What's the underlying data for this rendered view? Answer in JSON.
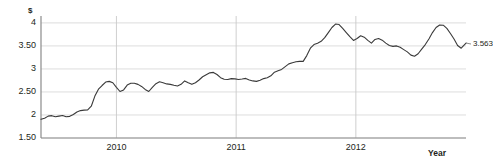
{
  "chart_data": {
    "type": "line",
    "title": "",
    "xlabel": "Year",
    "ylabel": "$",
    "ylim": [
      1.5,
      4.15
    ],
    "xlim": [
      2009.37,
      2012.92
    ],
    "grid": true,
    "legend": false,
    "y_ticks": [
      {
        "value": 4,
        "label": "4"
      },
      {
        "value": 3.5,
        "label": "3.50"
      },
      {
        "value": 3,
        "label": "3"
      },
      {
        "value": 2.5,
        "label": "2.50"
      },
      {
        "value": 2,
        "label": "2"
      },
      {
        "value": 1.5,
        "label": "1.50"
      }
    ],
    "x_ticks": [
      {
        "value": 2010,
        "label": "2010"
      },
      {
        "value": 2011,
        "label": "2011"
      },
      {
        "value": 2012,
        "label": "2012"
      }
    ],
    "annotations": [
      {
        "name": "last-value",
        "text": "3.563",
        "x": 2012.92,
        "y": 3.563
      }
    ],
    "series": [
      {
        "name": "price",
        "color": "#3a3a3a",
        "x": [
          2009.37,
          2009.4,
          2009.43,
          2009.46,
          2009.49,
          2009.52,
          2009.55,
          2009.58,
          2009.61,
          2009.64,
          2009.67,
          2009.7,
          2009.73,
          2009.76,
          2009.79,
          2009.82,
          2009.85,
          2009.88,
          2009.91,
          2009.94,
          2009.97,
          2010.0,
          2010.03,
          2010.06,
          2010.09,
          2010.12,
          2010.15,
          2010.18,
          2010.21,
          2010.24,
          2010.27,
          2010.3,
          2010.33,
          2010.36,
          2010.39,
          2010.42,
          2010.45,
          2010.48,
          2010.51,
          2010.54,
          2010.57,
          2010.6,
          2010.63,
          2010.66,
          2010.69,
          2010.72,
          2010.75,
          2010.78,
          2010.81,
          2010.84,
          2010.87,
          2010.9,
          2010.93,
          2010.96,
          2010.99,
          2011.02,
          2011.05,
          2011.08,
          2011.11,
          2011.14,
          2011.17,
          2011.2,
          2011.23,
          2011.26,
          2011.29,
          2011.32,
          2011.35,
          2011.38,
          2011.41,
          2011.44,
          2011.47,
          2011.5,
          2011.53,
          2011.56,
          2011.59,
          2011.62,
          2011.65,
          2011.68,
          2011.71,
          2011.74,
          2011.77,
          2011.8,
          2011.83,
          2011.86,
          2011.89,
          2011.92,
          2011.95,
          2011.98,
          2012.01,
          2012.04,
          2012.07,
          2012.1,
          2012.13,
          2012.16,
          2012.19,
          2012.22,
          2012.25,
          2012.28,
          2012.31,
          2012.34,
          2012.37,
          2012.4,
          2012.43,
          2012.46,
          2012.49,
          2012.52,
          2012.55,
          2012.58,
          2012.61,
          2012.64,
          2012.67,
          2012.7,
          2012.73,
          2012.76,
          2012.79,
          2012.82,
          2012.85,
          2012.88,
          2012.92
        ],
        "y": [
          1.905,
          1.93,
          1.975,
          1.985,
          1.96,
          1.975,
          1.99,
          1.96,
          1.97,
          2.01,
          2.065,
          2.095,
          2.105,
          2.11,
          2.19,
          2.41,
          2.56,
          2.64,
          2.715,
          2.73,
          2.7,
          2.6,
          2.51,
          2.545,
          2.65,
          2.69,
          2.69,
          2.665,
          2.62,
          2.555,
          2.51,
          2.6,
          2.68,
          2.72,
          2.7,
          2.675,
          2.665,
          2.645,
          2.63,
          2.665,
          2.74,
          2.7,
          2.665,
          2.7,
          2.76,
          2.83,
          2.875,
          2.915,
          2.925,
          2.88,
          2.81,
          2.775,
          2.77,
          2.79,
          2.785,
          2.77,
          2.78,
          2.795,
          2.76,
          2.74,
          2.73,
          2.755,
          2.79,
          2.81,
          2.85,
          2.93,
          2.96,
          2.99,
          3.05,
          3.11,
          3.135,
          3.155,
          3.165,
          3.165,
          3.29,
          3.45,
          3.53,
          3.56,
          3.6,
          3.68,
          3.79,
          3.9,
          3.975,
          3.965,
          3.88,
          3.79,
          3.7,
          3.62,
          3.66,
          3.72,
          3.69,
          3.62,
          3.56,
          3.64,
          3.66,
          3.625,
          3.56,
          3.51,
          3.49,
          3.5,
          3.47,
          3.42,
          3.37,
          3.3,
          3.275,
          3.33,
          3.43,
          3.53,
          3.65,
          3.79,
          3.9,
          3.955,
          3.95,
          3.88,
          3.77,
          3.65,
          3.51,
          3.45,
          3.563
        ]
      }
    ]
  },
  "axis": {
    "y_unit": "$",
    "x_title": "Year"
  }
}
